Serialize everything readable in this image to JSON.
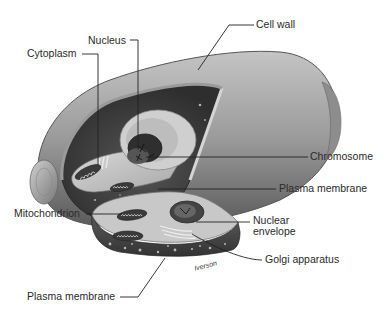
{
  "diagram": {
    "labels": {
      "cell_wall": "Cell wall",
      "nucleus": "Nucleus",
      "cytoplasm": "Cytoplasm",
      "chromosome": "Chromosome",
      "plasma_membrane_top": "Plasma membrane",
      "mitochondrion": "Mitochondrion",
      "nuclear_envelope_line1": "Nuclear",
      "nuclear_envelope_line2": "envelope",
      "golgi_apparatus": "Golgi apparatus",
      "plasma_membrane_bottom": "Plasma membrane"
    },
    "signature": "Iverson",
    "colors": {
      "wall_light": "#b8b8b8",
      "wall_mid": "#8a8a8a",
      "wall_dark": "#4a4a4a",
      "interior_dark": "#3a3a3a",
      "cytoplasm_light": "#c9c9c9",
      "nucleus_dark": "#2e2e2e",
      "leader_line": "#222222"
    }
  }
}
